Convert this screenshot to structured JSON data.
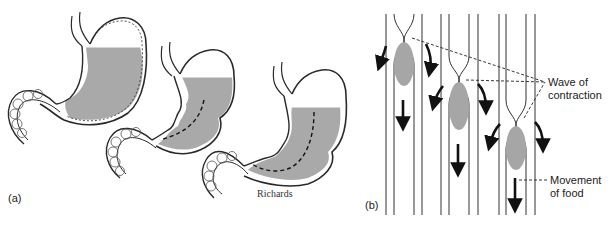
{
  "figure": {
    "panel_a": {
      "label": "(a)",
      "credit": "Richards",
      "stomachs": [
        {
          "name": "stomach-full",
          "stage": 1
        },
        {
          "name": "stomach-contracting",
          "stage": 2
        },
        {
          "name": "stomach-emptying",
          "stage": 3
        }
      ]
    },
    "panel_b": {
      "label": "(b)",
      "annotations": {
        "wave_line1": "Wave of",
        "wave_line2": "contraction",
        "movement_line1": "Movement",
        "movement_line2": "of food"
      },
      "tubes": [
        {
          "name": "tube-stage-1",
          "constriction_y": 40
        },
        {
          "name": "tube-stage-2",
          "constriction_y": 80
        },
        {
          "name": "tube-stage-3",
          "constriction_y": 125
        }
      ]
    },
    "colors": {
      "fluid": "#a9a9a9",
      "bolus": "#a6a6a6",
      "outline": "#2a2a2a",
      "arrow": "#111111"
    }
  }
}
